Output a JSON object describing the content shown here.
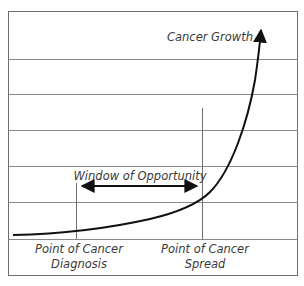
{
  "diagram": {
    "type": "concept-curve",
    "curve_label": "Cancer Growth",
    "window_label": "Window of Opportunity",
    "markers": [
      {
        "line1": "Point of Cancer",
        "line2": "Diagnosis"
      },
      {
        "line1": "Point of Cancer",
        "line2": "Spread"
      }
    ],
    "colors": {
      "grid": "#8a8a8a",
      "border": "#6e6e6e",
      "curve": "#111111",
      "text": "#3a3a3a",
      "background": "#ffffff"
    },
    "grid_rows": 6
  }
}
